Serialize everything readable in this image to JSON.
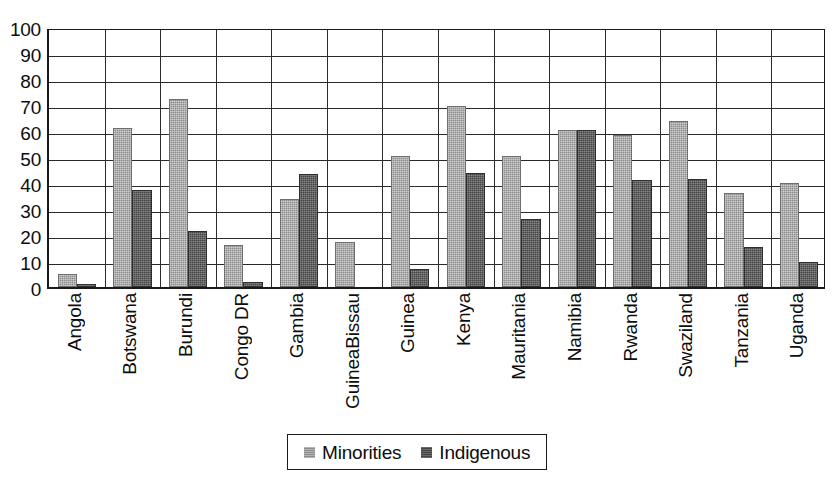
{
  "chart_data": {
    "type": "bar",
    "title": "",
    "subtitle": "",
    "xlabel": "",
    "ylabel": "",
    "ylim": [
      0,
      100
    ],
    "ytick_step": 10,
    "yticks": [
      100,
      90,
      80,
      70,
      60,
      50,
      40,
      30,
      20,
      10,
      0
    ],
    "grid": true,
    "grid_axis": "y",
    "legend_position": "bottom-center",
    "categories": [
      "Angola",
      "Botswana",
      "Burundi",
      "Congo DR",
      "Gambia",
      "GuineaBissau",
      "Guinea",
      "Kenya",
      "Mauritania",
      "Namibia",
      "Rwanda",
      "Swaziland",
      "Tanzania",
      "Uganda"
    ],
    "series": [
      {
        "name": "Minorities",
        "color": "#8c8c8c",
        "values": [
          5,
          61,
          72.5,
          16,
          34,
          17.5,
          50.5,
          69.5,
          50.5,
          60.5,
          58.5,
          64,
          36,
          40
        ]
      },
      {
        "name": "Indigenous",
        "color": "#454545",
        "values": [
          1,
          37.5,
          21.5,
          2,
          43.5,
          0,
          7,
          44,
          26,
          60.5,
          41,
          41.5,
          15.5,
          9.5
        ]
      }
    ]
  },
  "legend": {
    "entries": [
      {
        "label": "Minorities",
        "swatch": "minorities-swatch"
      },
      {
        "label": "Indigenous",
        "swatch": "indigenous-swatch"
      }
    ]
  },
  "colors": {
    "minorities": "#8c8c8c",
    "indigenous": "#454545",
    "axis": "#1a1a1a",
    "gridline": "#2b2b2b",
    "background": "#ffffff"
  }
}
